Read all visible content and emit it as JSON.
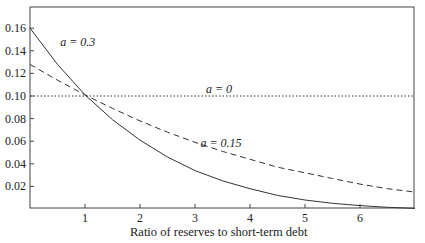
{
  "chart_data": {
    "type": "line",
    "title": "",
    "xlabel": "Ratio of reserves to short-term debt",
    "ylabel": "",
    "xlim": [
      0,
      7
    ],
    "ylim": [
      0,
      0.18
    ],
    "grid": false,
    "x_ticks": [
      "1",
      "2",
      "3",
      "4",
      "5",
      "6"
    ],
    "y_ticks": [
      "0.02",
      "0.04",
      "0.06",
      "0.08",
      "0.10",
      "0.12",
      "0.14",
      "0.16"
    ],
    "series": [
      {
        "name": "a = 0.3",
        "style": "solid",
        "x": [
          0,
          0.5,
          1,
          1.5,
          2,
          2.5,
          3,
          3.5,
          4,
          4.5,
          5,
          5.5,
          6,
          6.5,
          7
        ],
        "values": [
          0.16,
          0.128,
          0.101,
          0.079,
          0.061,
          0.046,
          0.034,
          0.025,
          0.018,
          0.012,
          0.008,
          0.005,
          0.003,
          0.0015,
          0.0005
        ]
      },
      {
        "name": "a = 0.15",
        "style": "dashed",
        "x": [
          0,
          0.5,
          1,
          1.5,
          2,
          2.5,
          3,
          3.5,
          4,
          4.5,
          5,
          5.5,
          6,
          6.5,
          7
        ],
        "values": [
          0.128,
          0.114,
          0.101,
          0.089,
          0.078,
          0.068,
          0.059,
          0.051,
          0.044,
          0.037,
          0.032,
          0.027,
          0.022,
          0.018,
          0.015
        ]
      },
      {
        "name": "a = 0",
        "style": "dotted",
        "x": [
          0,
          7
        ],
        "values": [
          0.1,
          0.1
        ]
      }
    ],
    "annotations": [
      {
        "text": "a = 0.3",
        "x": 0.55,
        "y": 0.148
      },
      {
        "text": "a = 0",
        "x": 3.2,
        "y": 0.106
      },
      {
        "text": "a = 0.15",
        "x": 3.1,
        "y": 0.058
      }
    ]
  }
}
